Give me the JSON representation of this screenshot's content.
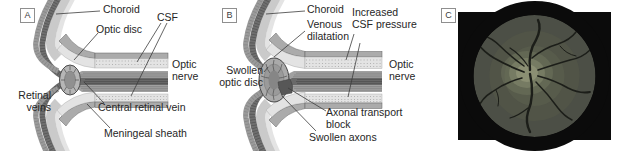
{
  "figure_title": "optic-disc-swelling-figure",
  "panels": {
    "a": {
      "letter": "A",
      "labels": {
        "choroid": "Choroid",
        "csf": "CSF",
        "optic_disc": "Optic disc",
        "optic_nerve": "Optic\nnerve",
        "retinal_veins": "Retinal\nveins",
        "central_retinal_vein": "Central retinal vein",
        "meningeal_sheath": "Meningeal sheath"
      }
    },
    "b": {
      "letter": "B",
      "labels": {
        "choroid": "Choroid",
        "venous_dilatation": "Venous\ndilatation",
        "increased_csf_pressure": "Increased\nCSF pressure",
        "swollen_optic_disc": "Swollen\noptic disc",
        "optic_nerve": "Optic\nnerve",
        "axonal_transport_block": "Axonal transport\nblock",
        "swollen_axons": "Swollen axons"
      }
    },
    "c": {
      "letter": "C"
    }
  },
  "colors": {
    "label_text": "#262626",
    "leader_line": "#3c3c3c",
    "retina_band": "#9a9a9a",
    "choroid_band": "#6f6f6f",
    "sclera_band": "#cacaca",
    "outer_band": "#e4e4e4",
    "meningeal_sheath": "#ababab",
    "csf_space": "#e3e3e3",
    "nerve_bundle": "#a0a0a0",
    "central_vessels": "#696969",
    "disc_fill": "#b6b6b6",
    "axonal_block": "#575757",
    "photo_background": "#0b0b0b",
    "fundus_field": "#4c4f46",
    "fundus_vessel": "#1c1e19",
    "fundus_disc_glow": "#999d7e"
  }
}
